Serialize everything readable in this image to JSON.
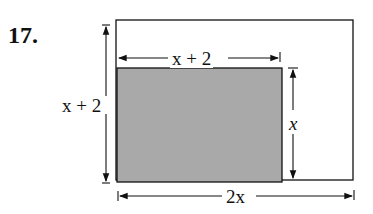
{
  "problem": {
    "number": "17.",
    "labels": {
      "top_width": "x + 2",
      "left_height": "x + 2",
      "right_height": "x",
      "bottom_width": "2x"
    },
    "colors": {
      "shaded_fill": "#a9a9a9",
      "line": "#111111"
    }
  }
}
